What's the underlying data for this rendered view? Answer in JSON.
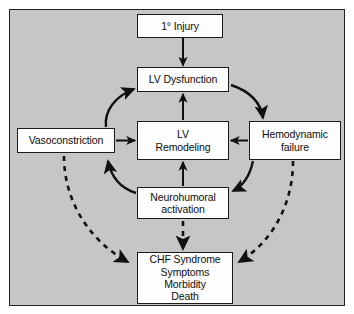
{
  "figure": {
    "background_color": "#c6c6c6",
    "frame_border_color": "#232323",
    "node_fill_color": "#fdfdfd",
    "edge_color": "#111111"
  },
  "nodes": [
    {
      "id": "primary-injury",
      "lines": [
        "1° Injury"
      ]
    },
    {
      "id": "lv-dysfunction",
      "lines": [
        "LV Dysfunction"
      ]
    },
    {
      "id": "vasoconstriction",
      "lines": [
        "Vasoconstriction"
      ]
    },
    {
      "id": "lv-remodeling",
      "lines": [
        "LV",
        "Remodeling"
      ]
    },
    {
      "id": "hemodynamic-failure",
      "lines": [
        "Hemodynamic",
        "failure"
      ]
    },
    {
      "id": "neurohumoral-activation",
      "lines": [
        "Neurohumoral",
        "activation"
      ]
    },
    {
      "id": "chf-syndrome",
      "lines": [
        "CHF Syndrome",
        "Symptoms",
        "Morbidity",
        "Death"
      ]
    }
  ],
  "edges": [
    {
      "id": "injury-to-dysfunction",
      "from": "primary-injury",
      "to": "lv-dysfunction",
      "style": "solid",
      "shape": "straight"
    },
    {
      "id": "remodeling-to-dysfunction",
      "from": "lv-remodeling",
      "to": "lv-dysfunction",
      "style": "solid",
      "shape": "straight"
    },
    {
      "id": "neurohumoral-to-remodeling",
      "from": "neurohumoral-activation",
      "to": "lv-remodeling",
      "style": "solid",
      "shape": "straight"
    },
    {
      "id": "vasoconstriction-to-remodeling",
      "from": "vasoconstriction",
      "to": "lv-remodeling",
      "style": "solid",
      "shape": "straight"
    },
    {
      "id": "hemodynamic-to-remodeling",
      "from": "hemodynamic-failure",
      "to": "lv-remodeling",
      "style": "solid",
      "shape": "straight"
    },
    {
      "id": "vasoconstriction-to-dysfunction",
      "from": "vasoconstriction",
      "to": "lv-dysfunction",
      "style": "solid",
      "shape": "curved"
    },
    {
      "id": "dysfunction-to-hemodynamic",
      "from": "lv-dysfunction",
      "to": "hemodynamic-failure",
      "style": "solid",
      "shape": "curved"
    },
    {
      "id": "hemodynamic-to-neurohumoral",
      "from": "hemodynamic-failure",
      "to": "neurohumoral-activation",
      "style": "solid",
      "shape": "curved"
    },
    {
      "id": "neurohumoral-to-remodeling-curve",
      "from": "neurohumoral-activation",
      "to": "lv-remodeling",
      "style": "solid",
      "shape": "curved"
    },
    {
      "id": "vasoconstriction-to-chf",
      "from": "vasoconstriction",
      "to": "chf-syndrome",
      "style": "dashed",
      "shape": "curved"
    },
    {
      "id": "neurohumoral-to-chf",
      "from": "neurohumoral-activation",
      "to": "chf-syndrome",
      "style": "dashed",
      "shape": "straight"
    },
    {
      "id": "hemodynamic-to-chf",
      "from": "hemodynamic-failure",
      "to": "chf-syndrome",
      "style": "dashed",
      "shape": "curved"
    }
  ]
}
